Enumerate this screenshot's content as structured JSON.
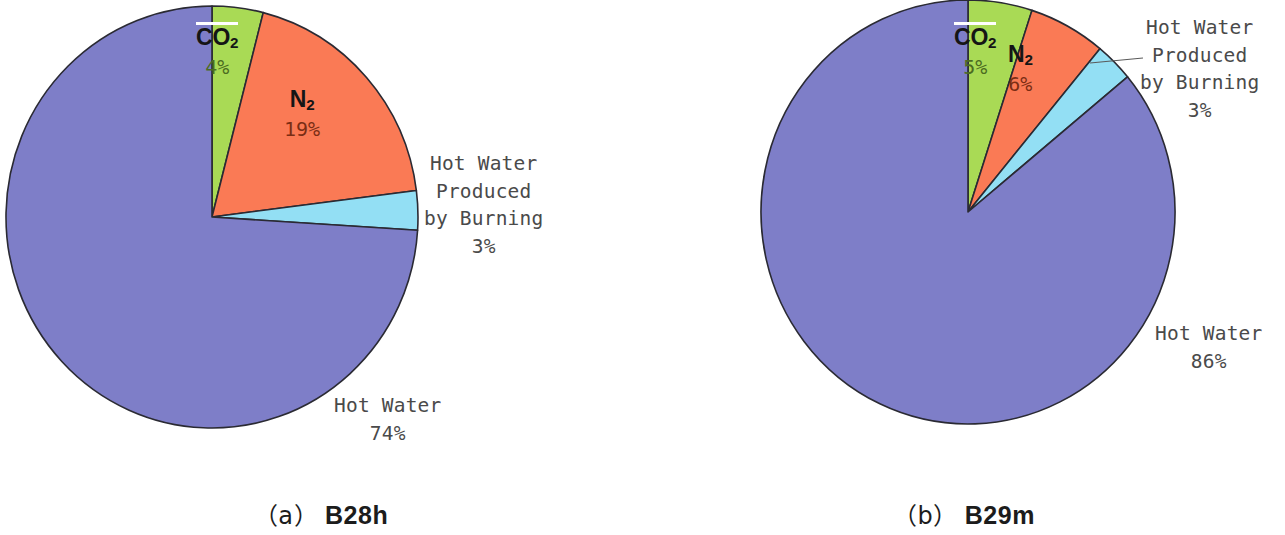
{
  "figure": {
    "background_color": "#ffffff",
    "panel_count": 2
  },
  "palette": {
    "hot_water": "#7e7ec8",
    "co2": "#a9da55",
    "n2": "#fa7a55",
    "hot_water_burning": "#93dff4",
    "slice_outline": "#2a2a33",
    "label_text": "#4a4a4a",
    "chem_text": "#151515",
    "highlight_line": "#ffffff"
  },
  "panels": [
    {
      "id": "panel-a",
      "caption_index": "（a）",
      "caption_name": "B28h",
      "geometry": {
        "cx": 212,
        "cy": 217,
        "rx": 206,
        "ry": 211
      },
      "labels": {
        "co2": {
          "name": "CO",
          "sub": "2",
          "pct": "4%"
        },
        "n2": {
          "name": "N",
          "sub": "2",
          "pct": "19%"
        },
        "burning": {
          "line1": "Hot Water",
          "line2": "Produced",
          "line3": "by Burning",
          "pct": "3%"
        },
        "hot_water": {
          "line1": "Hot Water",
          "pct": "74%"
        }
      },
      "chart_data": {
        "type": "pie",
        "title": "（a） B28h",
        "categories": [
          "CO2",
          "N2",
          "Hot Water Produced by Burning",
          "Hot Water"
        ],
        "values": [
          4,
          19,
          3,
          74
        ],
        "unit": "%",
        "colors": [
          "#a9da55",
          "#fa7a55",
          "#93dff4",
          "#7e7ec8"
        ],
        "start_angle_deg": 0,
        "direction": "clockwise",
        "legend": "none",
        "labels_position": "inside-and-outside"
      }
    },
    {
      "id": "panel-b",
      "caption_index": "（b）",
      "caption_name": "B29m",
      "geometry": {
        "cx": 325,
        "cy": 212,
        "rx": 207,
        "ry": 212
      },
      "labels": {
        "co2": {
          "name": "CO",
          "sub": "2",
          "pct": "5%"
        },
        "n2": {
          "name": "N",
          "sub": "2",
          "pct": "6%"
        },
        "burning": {
          "line1": "Hot Water",
          "line2": "Produced",
          "line3": "by Burning",
          "pct": "3%"
        },
        "hot_water": {
          "line1": "Hot Water",
          "pct": "86%"
        }
      },
      "chart_data": {
        "type": "pie",
        "title": "（b） B29m",
        "categories": [
          "CO2",
          "N2",
          "Hot Water Produced by Burning",
          "Hot Water"
        ],
        "values": [
          5,
          6,
          3,
          86
        ],
        "unit": "%",
        "colors": [
          "#a9da55",
          "#fa7a55",
          "#93dff4",
          "#7e7ec8"
        ],
        "start_angle_deg": 0,
        "direction": "clockwise",
        "legend": "none",
        "labels_position": "inside-and-outside"
      }
    }
  ],
  "chart_data": [
    {
      "type": "pie",
      "title": "（a） B28h",
      "categories": [
        "CO2",
        "N2",
        "Hot Water Produced by Burning",
        "Hot Water"
      ],
      "values": [
        4,
        19,
        3,
        74
      ],
      "unit": "%",
      "colors": [
        "#a9da55",
        "#fa7a55",
        "#93dff4",
        "#7e7ec8"
      ],
      "start_angle_deg": 0,
      "direction": "clockwise",
      "legend": "none"
    },
    {
      "type": "pie",
      "title": "（b） B29m",
      "categories": [
        "CO2",
        "N2",
        "Hot Water Produced by Burning",
        "Hot Water"
      ],
      "values": [
        5,
        6,
        3,
        86
      ],
      "unit": "%",
      "colors": [
        "#a9da55",
        "#fa7a55",
        "#93dff4",
        "#7e7ec8"
      ],
      "start_angle_deg": 0,
      "direction": "clockwise",
      "legend": "none"
    }
  ]
}
